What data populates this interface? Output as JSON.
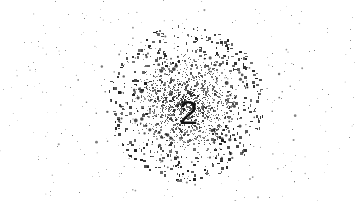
{
  "image": {
    "kind": "captcha-spatter-digit",
    "width": 355,
    "height": 201,
    "background_color": "#ffffff",
    "ink_color": "#3a3a3a",
    "description": "Grainy grayscale ink spatter blob with a dark digit overlaid on a white background"
  },
  "blob": {
    "center_x": 185,
    "center_y": 103,
    "core_radius": 46,
    "spatter_radius": 150,
    "core_gray": "#5a5a5a",
    "speck_color": "#2b2b2b",
    "density": 0.52,
    "grain_scale": 1.6
  },
  "characters": [
    {
      "text": "2",
      "x": 179,
      "y": 95,
      "size": 34,
      "weight": "400",
      "color": "#111111",
      "rotation": 0
    }
  ],
  "noise": {
    "speck_count": 2600,
    "droplet_count": 210,
    "min_speck_px": 1,
    "max_droplet_px": 5,
    "seed": 20873
  }
}
